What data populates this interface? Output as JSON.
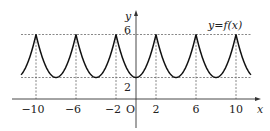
{
  "chart_data": {
    "type": "line",
    "title": "",
    "function_label": "y=f(x)",
    "xlabel": "x",
    "ylabel": "y",
    "origin_label": "O",
    "x_ticks": [
      -10,
      -6,
      -2,
      2,
      6,
      10
    ],
    "x_tick_labels": [
      "−10",
      "−6",
      "−2",
      "2",
      "6",
      "10"
    ],
    "y_ticks": [
      2,
      6
    ],
    "y_tick_labels": [
      "2",
      "6"
    ],
    "xlim": [
      -11.5,
      11.5
    ],
    "ylim": [
      0,
      7
    ],
    "peaks": [
      [
        -10,
        6
      ],
      [
        -6,
        6
      ],
      [
        -2,
        6
      ],
      [
        2,
        6
      ],
      [
        6,
        6
      ],
      [
        10,
        6
      ]
    ],
    "minima": [
      [
        -8,
        2
      ],
      [
        -4,
        2
      ],
      [
        0,
        2
      ],
      [
        4,
        2
      ],
      [
        8,
        2
      ]
    ],
    "period": 4,
    "max_value": 6,
    "min_value": 2,
    "grid": false,
    "dashed_guides": true
  }
}
